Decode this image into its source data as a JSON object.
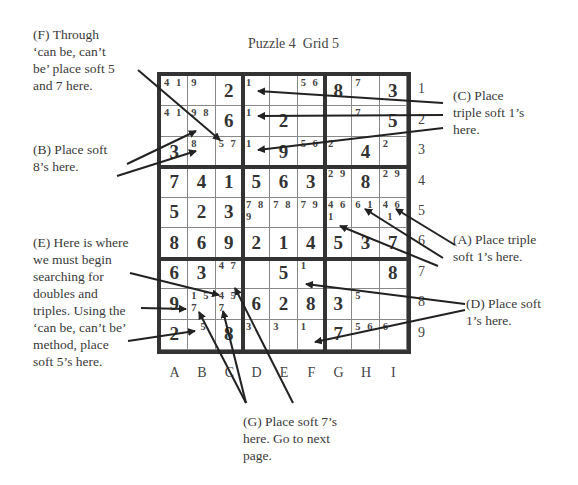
{
  "title": "Puzzle 4  Grid 5",
  "columns": [
    "A",
    "B",
    "C",
    "D",
    "E",
    "F",
    "G",
    "H",
    "I"
  ],
  "rows": [
    "1",
    "2",
    "3",
    "4",
    "5",
    "6",
    "7",
    "8",
    "9"
  ],
  "grid": [
    [
      {
        "p": "4 1"
      },
      {
        "p": "9"
      },
      {
        "v": "2"
      },
      {
        "p": "1"
      },
      {
        "p": ""
      },
      {
        "p": "5 6"
      },
      {
        "v": "8"
      },
      {
        "p": "7"
      },
      {
        "v": "3"
      }
    ],
    [
      {
        "p": "4 1"
      },
      {
        "p": "9 8"
      },
      {
        "v": "6"
      },
      {
        "p": "1"
      },
      {
        "v": "2"
      },
      {
        "p": ""
      },
      {
        "p": ""
      },
      {
        "p": "7"
      },
      {
        "v": "5"
      }
    ],
    [
      {
        "v": "3"
      },
      {
        "p": "8"
      },
      {
        "p": "5 7"
      },
      {
        "p": "1"
      },
      {
        "v": "9"
      },
      {
        "p": "5 6"
      },
      {
        "p": "2"
      },
      {
        "v": "4"
      },
      {
        "p": "2"
      }
    ],
    [
      {
        "v": "7"
      },
      {
        "v": "4"
      },
      {
        "v": "1"
      },
      {
        "v": "5"
      },
      {
        "v": "6"
      },
      {
        "v": "3"
      },
      {
        "p": "2 9"
      },
      {
        "v": "8"
      },
      {
        "p": "2 9"
      }
    ],
    [
      {
        "v": "5"
      },
      {
        "v": "2"
      },
      {
        "v": "3"
      },
      {
        "p": "7 8\n9"
      },
      {
        "p": "7 8"
      },
      {
        "p": "7 9"
      },
      {
        "p": "4 6\n1"
      },
      {
        "p": "6 1"
      },
      {
        "p": "4 6\n 1"
      }
    ],
    [
      {
        "v": "8"
      },
      {
        "v": "6"
      },
      {
        "v": "9"
      },
      {
        "v": "2"
      },
      {
        "v": "1"
      },
      {
        "v": "4"
      },
      {
        "v": "5"
      },
      {
        "v": "3"
      },
      {
        "v": "7"
      }
    ],
    [
      {
        "v": "6"
      },
      {
        "v": "3"
      },
      {
        "p": "4 7"
      },
      {
        "p": ""
      },
      {
        "v": "5"
      },
      {
        "p": "1"
      },
      {
        "p": ""
      },
      {
        "p": ""
      },
      {
        "v": "8"
      }
    ],
    [
      {
        "v": "9"
      },
      {
        "p": "1 5\n7"
      },
      {
        "p": "4 5\n7"
      },
      {
        "v": "6"
      },
      {
        "v": "2"
      },
      {
        "v": "8"
      },
      {
        "v": "3"
      },
      {
        "p": "5"
      },
      {
        "p": ""
      }
    ],
    [
      {
        "v": "2"
      },
      {
        "p": "  5"
      },
      {
        "v": "8"
      },
      {
        "p": "3"
      },
      {
        "p": "3"
      },
      {
        "p": "1"
      },
      {
        "v": "7"
      },
      {
        "p": "5 6"
      },
      {
        "p": "6"
      }
    ]
  ],
  "notes": {
    "F": "(F) Through\n‘can be, can’t\nbe’ place soft 5\nand 7 here.",
    "B": "(B) Place soft\n8’s here.",
    "E": "(E) Here is where\nwe must begin\nsearching for\ndoubles and\ntriples. Using the\n‘can be, can’t be’\nmethod, place\nsoft 5’s here.",
    "C": "(C) Place\ntriple soft 1’s\nhere.",
    "A": "(A) Place triple\nsoft 1’s here.",
    "D": "(D) Place soft\n1’s here.",
    "G": "(G) Place soft 7’s\nhere. Go to next\npage."
  },
  "colors": {
    "ink": "#333333",
    "text": "#3a3a3a",
    "thin_line": "#888888"
  }
}
